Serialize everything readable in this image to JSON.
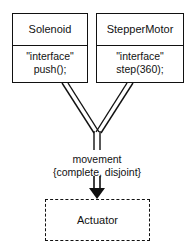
{
  "diagram": {
    "type": "uml-class-diagram",
    "background_color": "#ffffff",
    "line_color": "#111111",
    "classes": [
      {
        "id": "solenoid",
        "name": "Solenoid",
        "stereotype": "\"interface\"",
        "operation": "push();",
        "border_style": "solid"
      },
      {
        "id": "steppermotor",
        "name": "StepperMotor",
        "stereotype": "\"interface\"",
        "operation": "step(360);",
        "border_style": "solid"
      },
      {
        "id": "actuator",
        "name": "Actuator",
        "border_style": "dashed"
      }
    ],
    "generalization": {
      "discriminator": "movement",
      "constraint": "{complete, disjoint}",
      "arrow": "double-line-down-arrow"
    }
  }
}
